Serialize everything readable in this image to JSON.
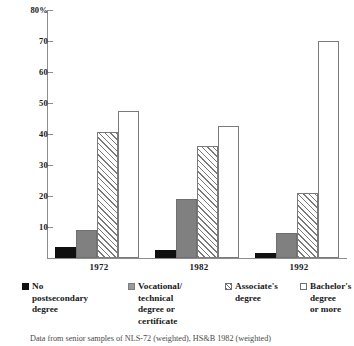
{
  "chart_data": {
    "type": "bar",
    "title": "",
    "xlabel": "",
    "ylabel": "",
    "ylim": [
      0,
      80
    ],
    "grid": false,
    "legend_position": "bottom",
    "categories": [
      "1972",
      "1982",
      "1992"
    ],
    "y_ticks": [
      "10",
      "20",
      "30",
      "40",
      "50",
      "60",
      "70",
      "80%"
    ],
    "y_tick_values": [
      10,
      20,
      30,
      40,
      50,
      60,
      70,
      80
    ],
    "series": [
      {
        "name": "No postsecondary degree",
        "values": [
          3.5,
          2.5,
          1.5
        ],
        "pattern": "solid-black"
      },
      {
        "name": "Vocational/technical degree or certificate",
        "values": [
          9,
          19,
          8
        ],
        "pattern": "solid-gray"
      },
      {
        "name": "Associate's degree",
        "values": [
          40.5,
          36,
          21
        ],
        "pattern": "hatched"
      },
      {
        "name": "Bachelor's degree or more",
        "values": [
          47.5,
          42.5,
          70
        ],
        "pattern": "empty"
      }
    ],
    "annotation": "Data from senior samples of NLS-72 (weighted), HS&B 1982 (weighted)"
  },
  "legend": {
    "items": [
      {
        "label_lines": "No postsecondary degree",
        "swatch": "solid-black-swatch"
      },
      {
        "label_lines": "Vocational/ technical degree or certificate",
        "swatch": "solid-gray-swatch"
      },
      {
        "label_lines": "Associate's degree",
        "swatch": "hatched-swatch"
      },
      {
        "label_lines": "Bachelor's degree or more",
        "swatch": "empty-swatch"
      }
    ]
  },
  "legend_text": {
    "item0_l1": "No",
    "item0_l2": "postsecondary",
    "item0_l3": "degree",
    "item1_l1": "Vocational/",
    "item1_l2": "technical",
    "item1_l3": "degree or",
    "item1_l4": "certificate",
    "item2_l1": "Associate's",
    "item2_l2": "degree",
    "item3_l1": "Bachelor's",
    "item3_l2": "degree",
    "item3_l3": "or more"
  },
  "axis": {
    "t10": "10",
    "t20": "20",
    "t30": "30",
    "t40": "40",
    "t50": "50",
    "t60": "60",
    "t70": "70",
    "t80": "80%"
  },
  "groups": {
    "g0": "1972",
    "g1": "1982",
    "g2": "1992"
  },
  "footnote": "Data from senior samples of NLS-72 (weighted), HS&B 1982 (weighted)"
}
